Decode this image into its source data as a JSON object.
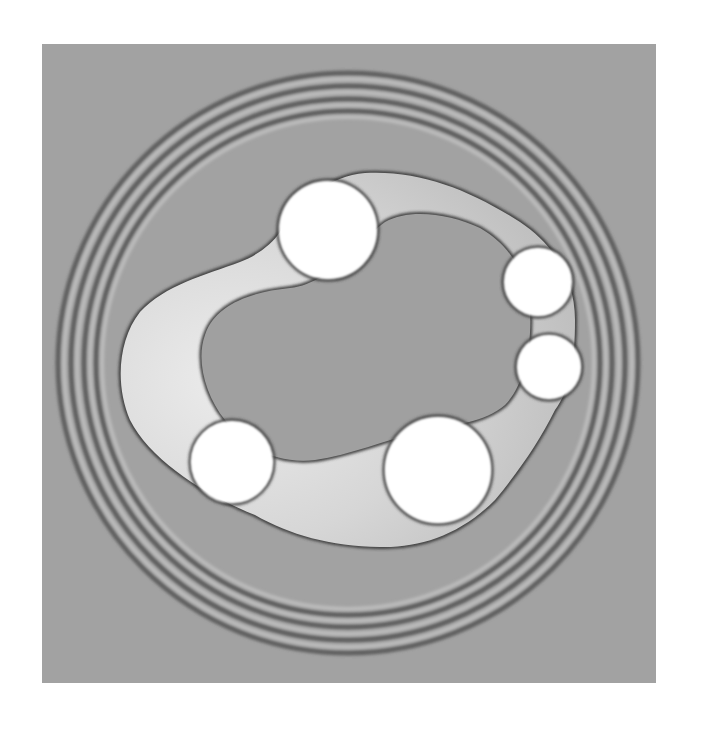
{
  "figure": {
    "panel": {
      "x": 42,
      "y": 44,
      "width": 614,
      "height": 639
    },
    "colors": {
      "page_background": "#ffffff",
      "field_background": "#a2a2a2",
      "ring_dark": "#5e5e5e",
      "ring_light": "#bcbcbc",
      "band_light": "#e2e2e2",
      "band_mid": "#c4c4c4",
      "interface_dark": "#3a3a3a",
      "core": "#a0a0a0",
      "particle": "#ffffff"
    },
    "rings": {
      "center": [
        348,
        363
      ],
      "radii": [
        290,
        277,
        264,
        252
      ],
      "stroke_width": 5
    },
    "outer_band_path": "M 280 232 C 300 200 330 176 365 173 C 420 170 470 190 520 222 C 555 245 575 280 575 320 C 575 360 570 390 555 410 C 540 440 520 470 495 500 C 460 535 420 548 380 547 C 330 546 290 535 255 515 C 205 495 150 460 130 420 C 115 385 118 340 140 312 C 165 285 205 275 240 262 C 258 255 272 244 280 232 Z",
    "inner_core_path": "M 385 222 C 410 208 450 214 480 228 C 510 245 528 275 530 310 C 532 345 525 385 505 405 C 485 422 455 425 420 432 C 385 440 350 455 315 460 C 280 464 245 450 225 420 C 205 395 196 360 205 335 C 215 305 250 292 290 288 C 330 284 360 240 385 222 Z",
    "particles": [
      {
        "name": "particle-top",
        "cx": 328,
        "cy": 230,
        "r": 49
      },
      {
        "name": "particle-right-upper",
        "cx": 538,
        "cy": 282,
        "r": 34
      },
      {
        "name": "particle-right-lower",
        "cx": 549,
        "cy": 367,
        "r": 32
      },
      {
        "name": "particle-bottom-left",
        "cx": 232,
        "cy": 462,
        "r": 41
      },
      {
        "name": "particle-bottom-right",
        "cx": 438,
        "cy": 470,
        "r": 53
      }
    ]
  }
}
